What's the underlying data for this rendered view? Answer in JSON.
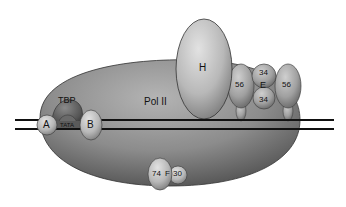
{
  "diagram": {
    "components": {
      "pol2": {
        "label": "Pol II"
      },
      "tfiih": {
        "label": "H"
      },
      "tbp": {
        "label": "TBP"
      },
      "tata": {
        "label": "TATA"
      },
      "tfiia": {
        "label": "A"
      },
      "tfiib": {
        "label": "B"
      },
      "tfiie": {
        "label": "E",
        "subunit_small": "34",
        "subunit_small_2": "34",
        "subunit_large": "56",
        "subunit_large_2": "56"
      },
      "tfiif": {
        "label": "F",
        "subunit_large": "74",
        "subunit_small": "30"
      }
    },
    "colors": {
      "protein_light": "#c8c8c8",
      "protein_mid": "#9a9a9a",
      "protein_dark": "#5e5e5e",
      "dna": "#111111",
      "background": "#ffffff"
    }
  }
}
